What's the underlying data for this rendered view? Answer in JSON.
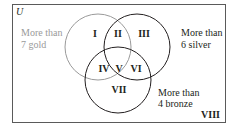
{
  "universe_label": "U",
  "sets": [
    {
      "id": "gold",
      "label_lines": [
        "More than",
        "7 gold"
      ],
      "color": "#9a9a9a"
    },
    {
      "id": "silver",
      "label_lines": [
        "More than",
        "6 silver"
      ],
      "color": "#231f20"
    },
    {
      "id": "bronze",
      "label_lines": [
        "More than",
        "4 bronze"
      ],
      "color": "#231f20"
    }
  ],
  "regions": [
    "I",
    "II",
    "III",
    "IV",
    "V",
    "VI",
    "VII",
    "VIII"
  ],
  "frame_color": "#5a5a5a"
}
